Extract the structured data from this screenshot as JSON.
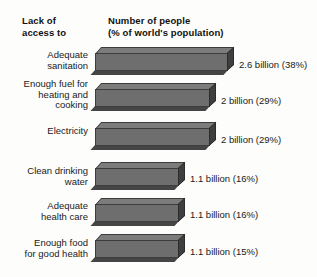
{
  "header": {
    "left_col_line1": "Lack of",
    "left_col_line2": "access to",
    "right_col_line1": "Number of people",
    "right_col_line2": "(% of world's population)"
  },
  "colors": {
    "background": "#fdfdfb",
    "bar_front": "#6e6e6e",
    "bar_top": "#7c7c7c",
    "bar_side": "#3f3f3f",
    "bar_shadow": "#454545",
    "text": "#1a1a1a"
  },
  "chart_data": {
    "type": "bar",
    "orientation": "horizontal",
    "title": "Number of people (% of world's population)",
    "xlabel": "Number of people (% of world's population)",
    "ylabel": "Lack of access to",
    "grid": false,
    "legend": false,
    "units": "billions of people",
    "categories": [
      "Adequate sanitation",
      "Enough fuel for heating and cooking",
      "Electricity",
      "Clean drinking water",
      "Adequate health care",
      "Enough food for good health"
    ],
    "values": [
      2.6,
      2.0,
      2.0,
      1.1,
      1.1,
      1.1
    ],
    "percentages": [
      38,
      29,
      29,
      16,
      16,
      15
    ],
    "xlim": [
      0,
      2.6
    ],
    "rows": [
      {
        "label_lines": [
          "Adequate",
          "sanitation"
        ],
        "value": 2.6,
        "percent": 38,
        "value_label": "2.6 billion (38%)"
      },
      {
        "label_lines": [
          "Enough fuel for",
          "heating and",
          "cooking"
        ],
        "value": 2.0,
        "percent": 29,
        "value_label": "2 billion (29%)"
      },
      {
        "label_lines": [
          "Electricity"
        ],
        "value": 2.0,
        "percent": 29,
        "value_label": "2 billion (29%)"
      },
      {
        "label_lines": [
          "Clean drinking",
          "water"
        ],
        "value": 1.1,
        "percent": 16,
        "value_label": "1.1 billion (16%)"
      },
      {
        "label_lines": [
          "Adequate",
          "health care"
        ],
        "value": 1.1,
        "percent": 16,
        "value_label": "1.1 billion (16%)"
      },
      {
        "label_lines": [
          "Enough food",
          "for good health"
        ],
        "value": 1.1,
        "percent": 15,
        "value_label": "1.1 billion (15%)"
      }
    ]
  },
  "layout": {
    "bar_lengths_px": [
      133,
      115,
      115,
      84,
      84,
      84
    ],
    "row_tops_px": [
      47,
      83,
      122,
      162,
      198,
      234
    ],
    "label_tops_px": [
      50,
      79,
      126,
      166,
      201,
      238
    ],
    "value_label_tops_px": [
      59,
      95,
      134,
      173,
      209,
      246
    ]
  }
}
